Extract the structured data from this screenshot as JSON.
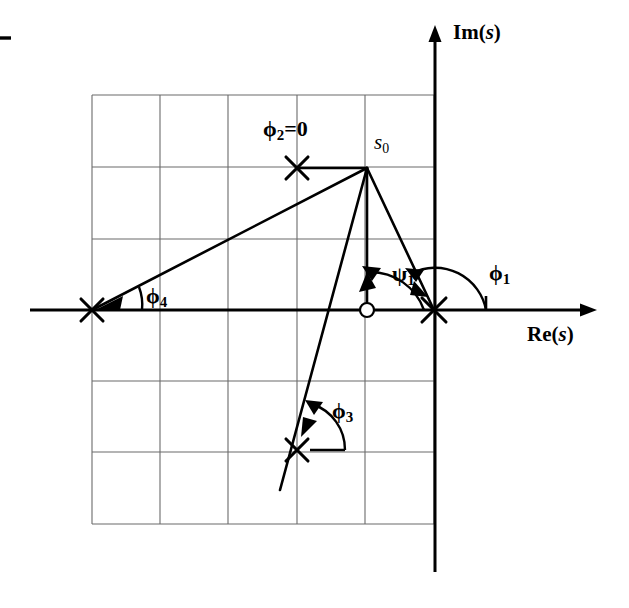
{
  "figure": {
    "background_color": "#ffffff",
    "ink_color": "#000000",
    "grid_color": "#6b6b6b"
  },
  "axes": {
    "real_axis_label": "Re(",
    "real_axis_var": "s",
    "real_axis_label_close": ")",
    "imag_axis_label": "Im(",
    "imag_axis_var": "s",
    "imag_axis_label_close": ")",
    "real_axis_y": 310,
    "imag_axis_x": 435,
    "real_axis_x_start": 30,
    "real_axis_x_end": 597,
    "imag_axis_y_top": 27,
    "imag_axis_y_bottom": 572
  },
  "grid": {
    "x_lines": [
      92,
      160,
      228,
      297,
      365,
      434
    ],
    "y_lines": [
      95,
      167,
      239,
      310,
      381,
      452,
      524
    ],
    "left": 92,
    "right": 434,
    "top": 95,
    "bottom": 524,
    "cell_width": 68,
    "cell_height": 71
  },
  "test_point": {
    "name": "s0",
    "label_base": "s",
    "label_sub": "0",
    "x": 367,
    "y": 168,
    "label_x": 374,
    "label_y": 142
  },
  "poles": [
    {
      "id": "pole-1",
      "angle_label_base": "φ",
      "angle_label_sub": "1",
      "angle_text": "φ₁",
      "x": 434,
      "y": 310,
      "marker": "x-cross"
    },
    {
      "id": "pole-2",
      "angle_label_base": "φ",
      "angle_label_sub": "2",
      "angle_text": "φ₂=0",
      "x": 297,
      "y": 168,
      "marker": "x-cross"
    },
    {
      "id": "pole-3",
      "angle_label_base": "φ",
      "angle_label_sub": "3",
      "angle_text": "φ₃",
      "x": 297,
      "y": 450,
      "marker": "x-cross"
    },
    {
      "id": "pole-4",
      "angle_label_base": "φ",
      "angle_label_sub": "4",
      "angle_text": "φ₄",
      "x": 92,
      "y": 310,
      "marker": "x-cross"
    }
  ],
  "zeros": [
    {
      "id": "zero-1",
      "angle_label_base": "ψ",
      "angle_label_sub": "1",
      "angle_text": "ψ₁",
      "x": 367,
      "y": 310,
      "marker": "circle",
      "radius": 7
    }
  ],
  "labels": {
    "phi1": {
      "base": "ϕ",
      "sub": "1",
      "x": 489,
      "y": 264
    },
    "phi2": {
      "base": "ϕ",
      "sub": "2",
      "suffix": "=0",
      "x": 263,
      "y": 124
    },
    "phi3": {
      "base": "ϕ",
      "sub": "3",
      "x": 330,
      "y": 407
    },
    "phi4": {
      "base": "ϕ",
      "sub": "4",
      "x": 143,
      "y": 288
    },
    "psi1": {
      "base": "ψ",
      "sub": "1",
      "x": 392,
      "y": 265
    },
    "re_axis": {
      "x": 527,
      "y": 325
    },
    "im_axis": {
      "x": 453,
      "y": 22
    }
  },
  "vectors": [
    {
      "id": "vec-to-pole1",
      "from": "s0",
      "to": "pole-1",
      "x1": 367,
      "y1": 168,
      "x2": 434,
      "y2": 310
    },
    {
      "id": "vec-to-pole2",
      "from": "s0",
      "to": "pole-2",
      "x1": 367,
      "y1": 168,
      "x2": 297,
      "y2": 168
    },
    {
      "id": "vec-to-pole3",
      "from": "s0",
      "to": "pole-3",
      "x1": 367,
      "y1": 168,
      "x2": 280,
      "y2": 490
    },
    {
      "id": "vec-to-pole4",
      "from": "s0",
      "to": "pole-4",
      "x1": 367,
      "y1": 168,
      "x2": 92,
      "y2": 310
    },
    {
      "id": "vec-to-zero1",
      "from": "s0",
      "to": "zero-1",
      "x1": 367,
      "y1": 168,
      "x2": 367,
      "y2": 310
    }
  ],
  "corner_mark": {
    "x1": 0,
    "y1": 38,
    "x2": 11,
    "y2": 38
  }
}
